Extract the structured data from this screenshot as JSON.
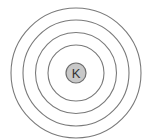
{
  "diagram": {
    "type": "bohr-model",
    "element_symbol": "K",
    "shell_count": 4,
    "colors": {
      "shell_stroke": "#7a7a7a",
      "nucleus_fill": "#c8c8c8",
      "nucleus_stroke": "#6e6e6e",
      "label": "#333333"
    }
  }
}
